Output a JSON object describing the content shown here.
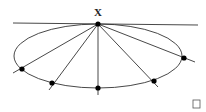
{
  "diagram": {
    "point_label": "X",
    "apex": {
      "x": 98,
      "y": 24
    },
    "tangent_line": {
      "x1": 13,
      "y1": 23,
      "x2": 198,
      "y2": 25
    },
    "ellipse": {
      "cx": 98,
      "cy": 56,
      "rx": 84,
      "ry": 32
    },
    "points": [
      {
        "x": 22,
        "y": 69,
        "ext_x": 13,
        "ext_y": 73
      },
      {
        "x": 52,
        "y": 83,
        "ext_x": 49,
        "ext_y": 90
      },
      {
        "x": 98,
        "y": 88,
        "ext_x": 98,
        "ext_y": 95
      },
      {
        "x": 154,
        "y": 81,
        "ext_x": 158,
        "ext_y": 87
      },
      {
        "x": 184,
        "y": 58,
        "ext_x": 195,
        "ext_y": 62
      }
    ],
    "colors": {
      "stroke": "#333333",
      "dot": "#000000"
    }
  }
}
